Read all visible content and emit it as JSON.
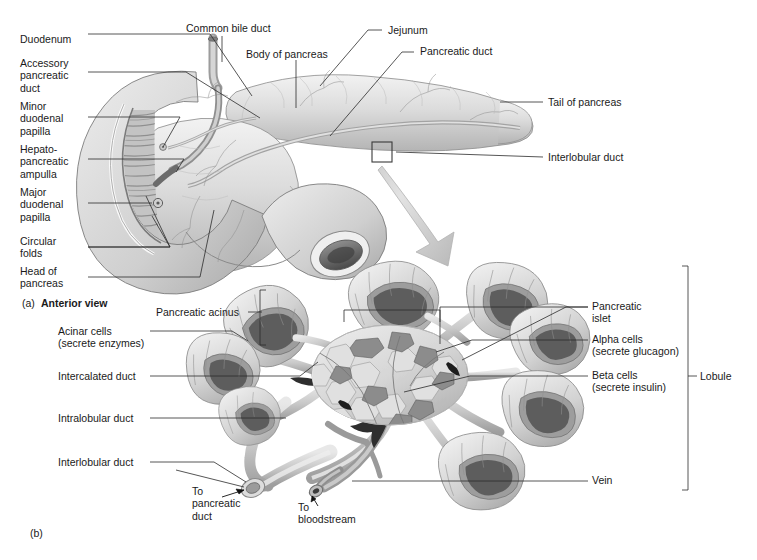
{
  "figure": {
    "background": "#ffffff",
    "leader_color": "#2b2b2b"
  },
  "panel_a": {
    "id": "(a)",
    "caption": "Anterior view",
    "labels_left": [
      {
        "text": "Duodenum",
        "x": 20,
        "y": 38
      },
      {
        "text": "Accessory\npancreatic\nduct",
        "x": 20,
        "y": 62
      },
      {
        "text": "Minor\nduodenal\npapilla",
        "x": 20,
        "y": 106
      },
      {
        "text": "Hepato-\npancreatic\nampulla",
        "x": 20,
        "y": 148
      },
      {
        "text": "Major\nduodenal\npapilla",
        "x": 20,
        "y": 192
      },
      {
        "text": "Circular\nfolds",
        "x": 20,
        "y": 236
      },
      {
        "text": "Head of\npancreas",
        "x": 20,
        "y": 266
      }
    ],
    "labels_top": [
      {
        "text": "Common bile duct",
        "x": 186,
        "y": 25
      },
      {
        "text": "Body of pancreas",
        "x": 246,
        "y": 50
      },
      {
        "text": "Jejunum",
        "x": 385,
        "y": 26
      },
      {
        "text": "Pancreatic duct",
        "x": 418,
        "y": 47
      }
    ],
    "labels_right": [
      {
        "text": "Tail of pancreas",
        "x": 547,
        "y": 98
      },
      {
        "text": "Interlobular duct",
        "x": 547,
        "y": 152
      }
    ]
  },
  "panel_b": {
    "id": "(b)",
    "labels_left": [
      {
        "text": "Pancreatic acinus",
        "x": 155,
        "y": 308
      },
      {
        "text": "Acinar cells\n(secrete enzymes)",
        "x": 58,
        "y": 327
      },
      {
        "text": "Intercalated duct",
        "x": 58,
        "y": 372
      },
      {
        "text": "Intralobular duct",
        "x": 58,
        "y": 414
      },
      {
        "text": "Interlobular duct",
        "x": 58,
        "y": 458
      }
    ],
    "labels_right": [
      {
        "text": "Pancreatic\nislet",
        "x": 592,
        "y": 302
      },
      {
        "text": "Alpha cells\n(secrete glucagon)",
        "x": 592,
        "y": 335
      },
      {
        "text": "Beta cells\n(secrete insulin)",
        "x": 592,
        "y": 371
      },
      {
        "text": "Vein",
        "x": 592,
        "y": 475
      }
    ],
    "labels_bottom": [
      {
        "text": "To\npancreatic\nduct",
        "x": 192,
        "y": 487
      },
      {
        "text": "To\nbloodstream",
        "x": 298,
        "y": 503
      }
    ],
    "bracket_labels": [
      {
        "text": "Lobule",
        "x": 700,
        "y": 371
      }
    ]
  }
}
